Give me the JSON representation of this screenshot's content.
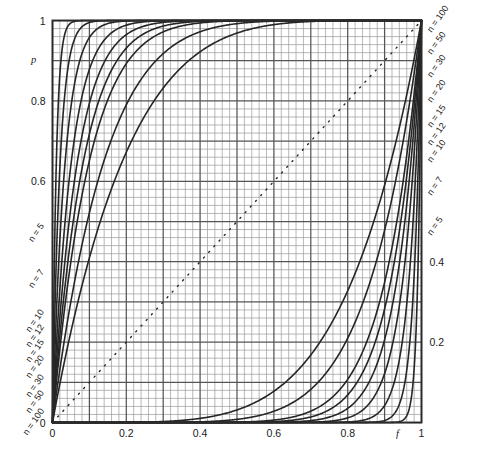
{
  "chart_data": {
    "type": "line",
    "title": "",
    "subtitle": "",
    "xlabel": "f",
    "ylabel": "p",
    "xlim": [
      0,
      1
    ],
    "ylim": [
      0,
      1
    ],
    "grid": true,
    "grid_major_step": 0.1,
    "grid_minor_step": 0.02,
    "legend_position": "inline-curve-ends",
    "x_ticks": [
      0,
      0.2,
      0.4,
      0.6,
      0.8,
      1
    ],
    "x_tick_labels": [
      "0",
      "0.2",
      "0.4",
      "0.6",
      "0.8",
      "1"
    ],
    "y_ticks_left": [
      0,
      0.2,
      0.4,
      0.6,
      0.8,
      1
    ],
    "y_tick_labels_left": [
      "0",
      "",
      "",
      "0.6",
      "0.8",
      "1"
    ],
    "y_ticks_right": [
      0.2,
      0.4
    ],
    "y_tick_labels_right": [
      "0.2",
      "0.4"
    ],
    "annotations": [
      {
        "text": "p = f",
        "style": "dotted-diagonal",
        "from": [
          0,
          0
        ],
        "to": [
          1,
          1
        ]
      }
    ],
    "series": [
      {
        "name": "n=100",
        "label": "n = 100",
        "branch": "upper",
        "n": 100,
        "formula": "p = 1-(1-f)^n"
      },
      {
        "name": "n=50",
        "label": "n = 50",
        "branch": "upper",
        "n": 50,
        "formula": "p = 1-(1-f)^n"
      },
      {
        "name": "n=30",
        "label": "n = 30",
        "branch": "upper",
        "n": 30,
        "formula": "p = 1-(1-f)^n"
      },
      {
        "name": "n=20",
        "label": "n = 20",
        "branch": "upper",
        "n": 20,
        "formula": "p = 1-(1-f)^n"
      },
      {
        "name": "n=15",
        "label": "n = 15",
        "branch": "upper",
        "n": 15,
        "formula": "p = 1-(1-f)^n"
      },
      {
        "name": "n=12",
        "label": "n = 12",
        "branch": "upper",
        "n": 12,
        "formula": "p = 1-(1-f)^n"
      },
      {
        "name": "n=10",
        "label": "n = 10",
        "branch": "upper",
        "n": 10,
        "formula": "p = 1-(1-f)^n"
      },
      {
        "name": "n=7",
        "label": "n = 7",
        "branch": "upper",
        "n": 7,
        "formula": "p = 1-(1-f)^n"
      },
      {
        "name": "n=5",
        "label": "n = 5",
        "branch": "upper",
        "n": 5,
        "formula": "p = 1-(1-f)^n"
      },
      {
        "name": "n=5L",
        "label": "n = 5",
        "branch": "lower",
        "n": 5,
        "formula": "p = f^n"
      },
      {
        "name": "n=7L",
        "label": "n = 7",
        "branch": "lower",
        "n": 7,
        "formula": "p = f^n"
      },
      {
        "name": "n=10L",
        "label": "n = 10",
        "branch": "lower",
        "n": 10,
        "formula": "p = f^n"
      },
      {
        "name": "n=12L",
        "label": "n = 12",
        "branch": "lower",
        "n": 12,
        "formula": "p = f^n"
      },
      {
        "name": "n=15L",
        "label": "n = 15",
        "branch": "lower",
        "n": 15,
        "formula": "p = f^n"
      },
      {
        "name": "n=20L",
        "label": "n = 20",
        "branch": "lower",
        "n": 20,
        "formula": "p = f^n"
      },
      {
        "name": "n=30L",
        "label": "n = 30",
        "branch": "lower",
        "n": 30,
        "formula": "p = f^n"
      },
      {
        "name": "n=50L",
        "label": "n = 50",
        "branch": "lower",
        "n": 50,
        "formula": "p = f^n"
      },
      {
        "name": "n=100L",
        "label": "n = 100",
        "branch": "lower",
        "n": 100,
        "formula": "p = f^n"
      }
    ]
  },
  "axes": {
    "y_left_label": "p",
    "x_right_label": "f",
    "x_tick_0": "0",
    "x_tick_02": "0.2",
    "x_tick_04": "0.4",
    "x_tick_06": "0.6",
    "x_tick_08": "0.8",
    "x_tick_1": "1",
    "y_tick_1": "1",
    "y_tick_08": "0.8",
    "y_tick_06": "0.6",
    "y_right_04": "0.4",
    "y_right_02": "0.2"
  },
  "curve_labels_right": [
    {
      "text": "n = 100"
    },
    {
      "text": "n = 50"
    },
    {
      "text": "n = 30"
    },
    {
      "text": "n = 20"
    },
    {
      "text": "n = 15"
    },
    {
      "text": "n = 12"
    },
    {
      "text": "n = 10"
    },
    {
      "text": "n = 7"
    },
    {
      "text": "n = 5"
    }
  ],
  "curve_labels_left": [
    {
      "text": "n = 5"
    },
    {
      "text": "n = 7"
    },
    {
      "text": "n = 10"
    },
    {
      "text": "n = 12"
    },
    {
      "text": "n = 15"
    },
    {
      "text": "n = 20"
    },
    {
      "text": "n = 30"
    },
    {
      "text": "n = 50"
    },
    {
      "text": "n = 100"
    }
  ],
  "colors": {
    "curve": "#262626",
    "grid_major": "#555555",
    "grid_minor": "#9a9a9a",
    "frame": "#2b2b2b",
    "text": "#1a1a1a",
    "background": "#ffffff"
  }
}
